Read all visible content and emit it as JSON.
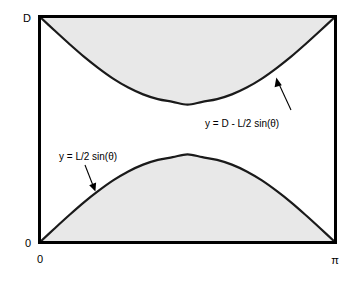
{
  "chart_data": {
    "type": "area",
    "title": "",
    "subtitle": "",
    "xlabel": "",
    "ylabel": "",
    "xlim": [
      0,
      3.14159
    ],
    "ylim": [
      0,
      1
    ],
    "grid": false,
    "legend_position": "none",
    "x_tick_labels": [
      "0",
      "π"
    ],
    "y_tick_labels": [
      "0",
      "D"
    ],
    "y_axis_top_label": "D",
    "y_axis_bottom_label": "0",
    "x_axis_left_label": "0",
    "x_axis_right_label": "π",
    "amplitude_fraction_of_D": 0.39,
    "series": [
      {
        "name": "y = D - L/2 sin(θ)",
        "equation": "y = D - L/2 sin(θ)",
        "fill_side": "above",
        "fill_color": "#e8e8e8",
        "x": [
          0,
          0.1571,
          0.3142,
          0.4712,
          0.6283,
          0.7854,
          0.9425,
          1.0996,
          1.2566,
          1.4137,
          1.5708,
          1.7279,
          1.885,
          2.042,
          2.1991,
          2.3562,
          2.5133,
          2.6704,
          2.8274,
          2.9845,
          3.1416
        ],
        "values": [
          1.0,
          0.9391,
          0.8795,
          0.8224,
          0.7708,
          0.7243,
          0.6857,
          0.6555,
          0.6345,
          0.6224,
          0.61,
          0.6224,
          0.6345,
          0.6555,
          0.6857,
          0.7243,
          0.7708,
          0.8224,
          0.8795,
          0.9391,
          1.0
        ]
      },
      {
        "name": "y = L/2 sin(θ)",
        "equation": "y = L/2 sin(θ)",
        "fill_side": "below",
        "fill_color": "#e8e8e8",
        "x": [
          0,
          0.1571,
          0.3142,
          0.4712,
          0.6283,
          0.7854,
          0.9425,
          1.0996,
          1.2566,
          1.4137,
          1.5708,
          1.7279,
          1.885,
          2.042,
          2.1991,
          2.3562,
          2.5133,
          2.6704,
          2.8274,
          2.9845,
          3.1416
        ],
        "values": [
          0.0,
          0.0609,
          0.1205,
          0.1776,
          0.2292,
          0.2757,
          0.3143,
          0.3445,
          0.3655,
          0.3776,
          0.39,
          0.3776,
          0.3655,
          0.3445,
          0.3143,
          0.2757,
          0.2292,
          0.1776,
          0.1205,
          0.0609,
          0.0
        ]
      }
    ],
    "annotations": [
      {
        "name": "upper-curve-annotation",
        "text": "y = D - L/2 sin(θ)",
        "target_curve": "y = D - L/2 sin(θ)"
      },
      {
        "name": "lower-curve-annotation",
        "text": "y = L/2 sin(θ)",
        "target_curve": "y = L/2 sin(θ)"
      }
    ],
    "colors": {
      "shade": "#e8e8e8",
      "curve": "#1a1a1a",
      "frame": "#000000",
      "background": "#ffffff"
    }
  }
}
